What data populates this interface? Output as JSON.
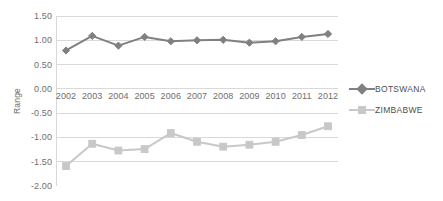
{
  "chart_data": {
    "type": "line",
    "title": "",
    "xlabel": "",
    "ylabel": "Range",
    "categories": [
      "2002",
      "2003",
      "2004",
      "2005",
      "2006",
      "2007",
      "2008",
      "2009",
      "2010",
      "2011",
      "2012"
    ],
    "ylim": [
      -2.0,
      1.5
    ],
    "ytick_labels": [
      "1.50",
      "1.00",
      "0.50",
      "0.00",
      "-0.50",
      "-1.00",
      "-1.50",
      "-2.00"
    ],
    "ytick_values": [
      1.5,
      1.0,
      0.5,
      0.0,
      -0.5,
      -1.0,
      -1.5,
      -2.0
    ],
    "grid": true,
    "legend_position": "right",
    "series": [
      {
        "name": "BOTSWANA",
        "color": "#808080",
        "marker": "diamond",
        "values": [
          0.79,
          1.09,
          0.89,
          1.07,
          0.98,
          1.0,
          1.01,
          0.95,
          0.98,
          1.07,
          1.13
        ]
      },
      {
        "name": "ZIMBABWE",
        "color": "#c8c8c8",
        "marker": "square",
        "values": [
          -1.59,
          -1.13,
          -1.27,
          -1.24,
          -0.91,
          -1.09,
          -1.19,
          -1.15,
          -1.09,
          -0.95,
          -0.77
        ]
      }
    ]
  },
  "colors": {
    "gridline": "#d9d9d9",
    "axis_text": "#6e6e6e",
    "legend_text": "#4d4d4d",
    "plot_background": "#ffffff"
  }
}
